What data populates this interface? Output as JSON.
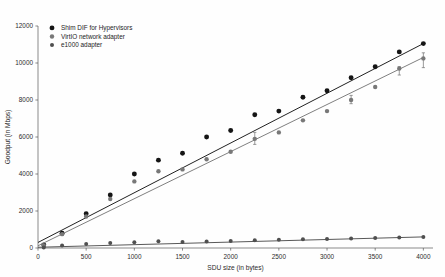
{
  "chart_data": {
    "type": "scatter",
    "title": "",
    "xlabel": "SDU size (in bytes)",
    "ylabel": "Goodput (in Mbps)",
    "xlim": [
      0,
      4100
    ],
    "ylim": [
      0,
      12000
    ],
    "xticks": [
      0,
      500,
      1000,
      1500,
      2000,
      2500,
      3000,
      3500,
      4000
    ],
    "yticks": [
      0,
      2000,
      4000,
      6000,
      8000,
      10000,
      12000
    ],
    "xtick_labels": [
      "0",
      "500",
      "1000",
      "1500",
      "2000",
      "2500",
      "3000",
      "3500",
      "4000"
    ],
    "ytick_labels": [
      "0",
      "2000",
      "4000",
      "6000",
      "8000",
      "10000",
      "12000"
    ],
    "grid": false,
    "legend_position": "upper left",
    "markers": "filled-circle",
    "fit_lines": true,
    "series": [
      {
        "name": "Shim DIF for Hypervisors",
        "color": "#151515",
        "x": [
          60,
          250,
          500,
          750,
          1000,
          1250,
          1500,
          1750,
          2000,
          2250,
          2500,
          2750,
          3000,
          3250,
          3500,
          3750,
          4000
        ],
        "values": [
          170,
          800,
          1850,
          2870,
          4000,
          4750,
          5120,
          6000,
          6350,
          7200,
          7400,
          8150,
          8500,
          9200,
          9800,
          10600,
          11050
        ],
        "fit": {
          "x0": 0,
          "y0": 300,
          "x1": 4000,
          "y1": 11050
        }
      },
      {
        "name": "VirtIO network adapter",
        "color": "#787878",
        "x": [
          60,
          250,
          500,
          750,
          1000,
          1250,
          1500,
          1750,
          2000,
          2250,
          2500,
          2750,
          3000,
          3250,
          3500,
          3750,
          4000
        ],
        "values": [
          140,
          750,
          1700,
          2650,
          3600,
          4150,
          4250,
          4800,
          5200,
          5900,
          6250,
          6900,
          7400,
          8000,
          8700,
          9700,
          10250
        ],
        "fit": {
          "x0": 0,
          "y0": 120,
          "x1": 4000,
          "y1": 10300
        },
        "errorbars": [
          {
            "x": 2250,
            "low": 5600,
            "high": 6250
          },
          {
            "x": 3250,
            "low": 7800,
            "high": 8250
          },
          {
            "x": 3750,
            "low": 9350,
            "high": 9800
          },
          {
            "x": 4000,
            "low": 9750,
            "high": 10550
          }
        ]
      },
      {
        "name": "e1000 adapter",
        "color": "#4f4f4f",
        "x": [
          60,
          250,
          500,
          750,
          1000,
          1250,
          1500,
          1750,
          2000,
          2250,
          2500,
          2750,
          3000,
          3250,
          3500,
          3750,
          4000
        ],
        "values": [
          30,
          130,
          210,
          270,
          310,
          360,
          330,
          345,
          380,
          420,
          450,
          470,
          490,
          510,
          540,
          570,
          600
        ],
        "fit": {
          "x0": 0,
          "y0": 40,
          "x1": 4000,
          "y1": 600
        }
      }
    ]
  },
  "legend": {
    "entries": [
      {
        "label": "Shim DIF for Hypervisors",
        "swatch": "legend-marker-shim-dif"
      },
      {
        "label": "VirtIO network adapter",
        "swatch": "legend-marker-virtio"
      },
      {
        "label": "e1000 adapter",
        "swatch": "legend-marker-e1000"
      }
    ]
  }
}
